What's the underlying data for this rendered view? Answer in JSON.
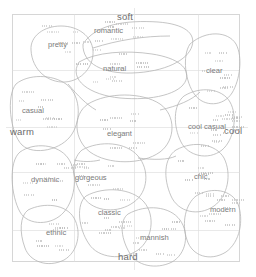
{
  "chart_data": {
    "type": "scatter",
    "title": "",
    "xlabel": "warm — cool",
    "ylabel": "soft — hard",
    "xlim": [
      0,
      100
    ],
    "ylim": [
      0,
      100
    ],
    "grid": true,
    "legend": "none",
    "axis_labels": {
      "top": "soft",
      "bottom": "hard",
      "left": "warm",
      "right": "cool"
    },
    "categories": [
      "pretty",
      "romantic",
      "natural",
      "clear",
      "casual",
      "elegant",
      "cool casual",
      "dynamic",
      "gorgeous",
      "chic",
      "classic",
      "modern",
      "ethnic",
      "mannish"
    ],
    "clusters": [
      {
        "label": "pretty",
        "x": 24,
        "y": 88,
        "px": 60,
        "py": 44
      },
      {
        "label": "romantic",
        "x": 43,
        "y": 94,
        "px": 110,
        "py": 30
      },
      {
        "label": "natural",
        "x": 45,
        "y": 78,
        "px": 115,
        "py": 68
      },
      {
        "label": "clear",
        "x": 88,
        "y": 77,
        "px": 214,
        "py": 70
      },
      {
        "label": "casual",
        "x": 9,
        "y": 62,
        "px": 33,
        "py": 110
      },
      {
        "label": "elegant",
        "x": 47,
        "y": 54,
        "px": 119,
        "py": 133
      },
      {
        "label": "cool casual",
        "x": 81,
        "y": 54,
        "px": 203,
        "py": 126
      },
      {
        "label": "cool",
        "x": 94,
        "y": 50,
        "px": 232,
        "py": 131
      },
      {
        "label": "dynamic",
        "x": 15,
        "y": 37,
        "px": 45,
        "py": 180
      },
      {
        "label": "gorgeous",
        "x": 34,
        "y": 36,
        "px": 92,
        "py": 178
      },
      {
        "label": "chic",
        "x": 77,
        "y": 35,
        "px": 200,
        "py": 177
      },
      {
        "label": "classic",
        "x": 41,
        "y": 21,
        "px": 110,
        "py": 212
      },
      {
        "label": "modern",
        "x": 88,
        "y": 22,
        "px": 222,
        "py": 209
      },
      {
        "label": "ethnic",
        "x": 19,
        "y": 12,
        "px": 58,
        "py": 232
      },
      {
        "label": "mannish",
        "x": 58,
        "y": 11,
        "px": 151,
        "py": 237
      }
    ],
    "frame": {
      "left": 12,
      "top": 14,
      "right": 240,
      "bottom": 262
    },
    "gridlines": {
      "vertical": [
        74,
        134,
        198
      ],
      "horizontal": [
        70,
        127,
        172,
        230
      ]
    }
  },
  "labels": {
    "soft": "soft",
    "hard": "hard",
    "warm": "warm",
    "cool": "cool",
    "pretty": "pretty",
    "romantic": "romantic",
    "natural": "natural",
    "clear": "clear",
    "casual": "casual",
    "elegant": "elegant",
    "cool_casual": "cool casual",
    "cool2": "cool",
    "dynamic": "dynamic",
    "gorgeous": "gorgeous",
    "chic": "chic",
    "classic": "classic",
    "modern": "modern",
    "ethnic": "ethnic",
    "mannish": "mannish"
  },
  "colors": {
    "background": "#ffffff",
    "frame": "#d6d6d6",
    "grid": "#dcdcdc",
    "blob": "#b0b0b0",
    "axis_text": "#6b6b6b",
    "group_text": "#7a7a7a",
    "micro_text": "#b9b9b9"
  }
}
